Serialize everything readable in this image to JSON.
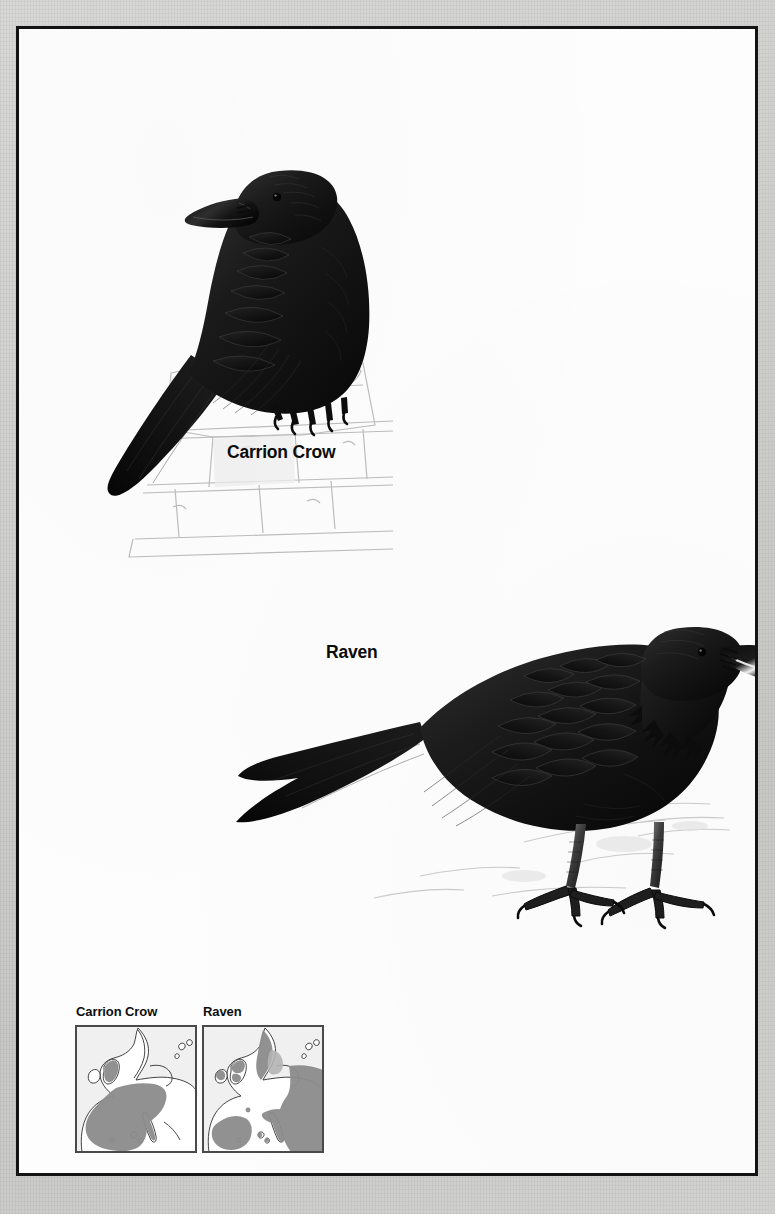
{
  "plate": {
    "kind": "bird-identification-plate",
    "background_color": "#fdfdfd",
    "border_color": "#131313",
    "page_surround_color": "#cfcfcd",
    "figures": [
      {
        "id": "carrion-crow",
        "label": "Carrion Crow",
        "pose": "perched on stone wall, facing left",
        "plumage_color": "#151515",
        "substrate": "pencil-drawn stone wall"
      },
      {
        "id": "raven",
        "label": "Raven",
        "pose": "standing on ground, facing right",
        "plumage_color": "#141414",
        "substrate": "faint pencil ground shading"
      }
    ]
  },
  "labels": {
    "carrion_crow": "Carrion Crow",
    "raven": "Raven"
  },
  "maps": {
    "section_name": "distribution-maps",
    "land_color": "#f2f2f2",
    "sea_color": "#ffffff",
    "range_color": "#8c8c8c",
    "range_color_light": "#b4b4b4",
    "coast_color": "#2e2e2e",
    "items": [
      {
        "id": "map-carrion-crow",
        "caption": "Carrion Crow",
        "region": "Europe",
        "range_description": "Western and south-western Europe: Britain, France, Iberia, Alps, Italy"
      },
      {
        "id": "map-raven",
        "caption": "Raven",
        "region": "Europe",
        "range_description": "Scandinavia, eastern Europe, Iberia, Alps, Balkans, northern Britain"
      }
    ]
  }
}
